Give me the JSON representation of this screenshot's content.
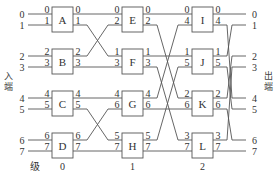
{
  "diagram": {
    "type": "multistage-switching-network",
    "input_label": "入端",
    "output_label": "出端",
    "stage_prefix": "级",
    "stages": [
      "0",
      "1",
      "2"
    ],
    "inputs": [
      "0",
      "1",
      "2",
      "3",
      "4",
      "5",
      "6",
      "7"
    ],
    "outputs": [
      "0",
      "1",
      "2",
      "3",
      "4",
      "5",
      "6",
      "7"
    ],
    "switches": [
      {
        "name": "A",
        "stage": 0,
        "in": [
          "0",
          "1"
        ],
        "out": [
          "0",
          "1"
        ]
      },
      {
        "name": "B",
        "stage": 0,
        "in": [
          "2",
          "3"
        ],
        "out": [
          "2",
          "3"
        ]
      },
      {
        "name": "C",
        "stage": 0,
        "in": [
          "4",
          "5"
        ],
        "out": [
          "4",
          "5"
        ]
      },
      {
        "name": "D",
        "stage": 0,
        "in": [
          "6",
          "7"
        ],
        "out": [
          "6",
          "7"
        ]
      },
      {
        "name": "E",
        "stage": 1,
        "in": [
          "0",
          "2"
        ],
        "out": [
          "0",
          "2"
        ]
      },
      {
        "name": "F",
        "stage": 1,
        "in": [
          "1",
          "3"
        ],
        "out": [
          "1",
          "3"
        ]
      },
      {
        "name": "G",
        "stage": 1,
        "in": [
          "4",
          "6"
        ],
        "out": [
          "4",
          "6"
        ]
      },
      {
        "name": "H",
        "stage": 1,
        "in": [
          "5",
          "7"
        ],
        "out": [
          "5",
          "7"
        ]
      },
      {
        "name": "I",
        "stage": 2,
        "in": [
          "0",
          "4"
        ],
        "out": [
          "0",
          "4"
        ]
      },
      {
        "name": "J",
        "stage": 2,
        "in": [
          "1",
          "5"
        ],
        "out": [
          "1",
          "5"
        ]
      },
      {
        "name": "K",
        "stage": 2,
        "in": [
          "2",
          "6"
        ],
        "out": [
          "2",
          "6"
        ]
      },
      {
        "name": "L",
        "stage": 2,
        "in": [
          "3",
          "7"
        ],
        "out": [
          "3",
          "7"
        ]
      }
    ],
    "links": [
      {
        "from": "A.0",
        "to": "E.0"
      },
      {
        "from": "A.1",
        "to": "F.1"
      },
      {
        "from": "B.2",
        "to": "E.2"
      },
      {
        "from": "B.3",
        "to": "F.3"
      },
      {
        "from": "C.4",
        "to": "G.4"
      },
      {
        "from": "C.5",
        "to": "H.5"
      },
      {
        "from": "D.6",
        "to": "G.6"
      },
      {
        "from": "D.7",
        "to": "H.7"
      },
      {
        "from": "E.0",
        "to": "I.0"
      },
      {
        "from": "E.2",
        "to": "K.2"
      },
      {
        "from": "F.1",
        "to": "J.1"
      },
      {
        "from": "F.3",
        "to": "L.3"
      },
      {
        "from": "G.4",
        "to": "I.4"
      },
      {
        "from": "G.6",
        "to": "K.6"
      },
      {
        "from": "H.5",
        "to": "J.5"
      },
      {
        "from": "H.7",
        "to": "L.7"
      },
      {
        "from": "I.0",
        "to": "out.0"
      },
      {
        "from": "I.4",
        "to": "out.4"
      },
      {
        "from": "J.1",
        "to": "out.1"
      },
      {
        "from": "J.5",
        "to": "out.5"
      },
      {
        "from": "K.2",
        "to": "out.2"
      },
      {
        "from": "K.6",
        "to": "out.6"
      },
      {
        "from": "L.3",
        "to": "out.3"
      },
      {
        "from": "L.7",
        "to": "out.7"
      }
    ],
    "colors": {
      "line": "#555555",
      "box": "#555555",
      "text": "#333333"
    }
  }
}
